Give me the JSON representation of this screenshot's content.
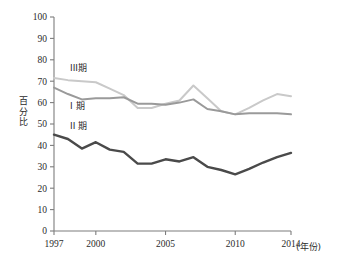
{
  "chart_data": {
    "type": "line",
    "title": "",
    "xlabel": "(年份)",
    "ylabel": "百分比",
    "ylim": [
      0,
      100
    ],
    "xlim": [
      1997,
      2014
    ],
    "grid": false,
    "legend_position": "inline-annotations",
    "y_ticks": [
      "0",
      "10",
      "20",
      "30",
      "40",
      "50",
      "60",
      "70",
      "80",
      "90",
      "100"
    ],
    "x_ticks": [
      "1997",
      "2000",
      "2005",
      "2010",
      "2014"
    ],
    "x": [
      1997,
      1998,
      1999,
      2000,
      2001,
      2002,
      2003,
      2004,
      2005,
      2006,
      2007,
      2008,
      2009,
      2010,
      2011,
      2012,
      2013,
      2014
    ],
    "series": [
      {
        "name": "III期",
        "color": "#c9c9c9",
        "width": 2.0,
        "values": [
          71.5,
          70.5,
          70.0,
          69.5,
          66.5,
          63.5,
          57.5,
          57.5,
          59.5,
          61.0,
          68.0,
          62.0,
          56.0,
          54.5,
          57.5,
          61.0,
          64.0,
          63.0
        ]
      },
      {
        "name": "I 期",
        "color": "#9a9a9a",
        "width": 2.0,
        "values": [
          67.0,
          64.0,
          61.5,
          62.0,
          62.0,
          62.5,
          59.5,
          59.5,
          59.0,
          60.0,
          61.5,
          57.0,
          56.0,
          54.5,
          55.0,
          55.0,
          55.0,
          54.5
        ]
      },
      {
        "name": "II 期",
        "color": "#4a4a4a",
        "width": 2.4,
        "values": [
          45.0,
          43.0,
          38.5,
          41.5,
          38.0,
          37.0,
          31.5,
          31.5,
          33.5,
          32.5,
          34.5,
          30.0,
          28.5,
          26.5,
          29.0,
          32.0,
          34.5,
          36.5
        ]
      }
    ],
    "annotations": [
      {
        "text": "III期",
        "series": "III期",
        "x_px": 70,
        "y_px": 71
      },
      {
        "text": "I 期",
        "series": "I 期",
        "x_px": 70,
        "y_px": 109
      },
      {
        "text": "II 期",
        "series": "II 期",
        "x_px": 70,
        "y_px": 129
      }
    ]
  }
}
